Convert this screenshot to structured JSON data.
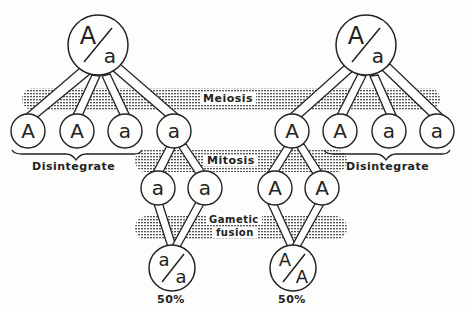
{
  "colors": {
    "ink": "#222222",
    "background": "#fdfdfb",
    "stipple": "#555555"
  },
  "stages": {
    "meiosis": "Meiosis",
    "mitosis": "Mitosis",
    "gametic_fusion_line1": "Gametic",
    "gametic_fusion_line2": "fusion"
  },
  "left": {
    "parent": {
      "top": "A",
      "bottom": "a"
    },
    "meiosis_products": [
      "A",
      "A",
      "a",
      "a"
    ],
    "disintegrate_label": "Disintegrate",
    "mitosis_products": [
      "a",
      "a"
    ],
    "fusion_product": {
      "top": "a",
      "bottom": "a"
    },
    "percentage": "50%"
  },
  "right": {
    "parent": {
      "top": "A",
      "bottom": "a"
    },
    "meiosis_products": [
      "A",
      "A",
      "a",
      "a"
    ],
    "disintegrate_label": "Disintegrate",
    "mitosis_products": [
      "A",
      "A"
    ],
    "fusion_product": {
      "top": "A",
      "bottom": "A"
    },
    "percentage": "50%"
  }
}
